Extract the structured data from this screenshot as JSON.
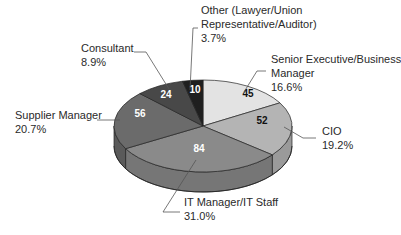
{
  "chart_data": {
    "type": "pie",
    "style": "3d-exploded-none",
    "title": "",
    "start_angle_deg": 0,
    "direction": "clockwise",
    "slices": [
      {
        "label": "Senior Executive/Business Manager",
        "label_lines": [
          "Senior Executive/Business",
          "Manager",
          "16.6%"
        ],
        "value": 45,
        "percent": "16.6%",
        "color": "#e3e3e3",
        "side": "#c4c4c4",
        "value_color": "#111111"
      },
      {
        "label": "CIO",
        "label_lines": [
          "CIO",
          "19.2%"
        ],
        "value": 52,
        "percent": "19.2%",
        "color": "#b4b4b4",
        "side": "#9a9a9a",
        "value_color": "#111111"
      },
      {
        "label": "IT Manager/IT Staff",
        "label_lines": [
          "IT Manager/IT Staff",
          "31.0%"
        ],
        "value": 84,
        "percent": "31.0%",
        "color": "#8a8a8a",
        "side": "#767676",
        "value_color": "#ffffff"
      },
      {
        "label": "Supplier Manager",
        "label_lines": [
          "Supplier Manager",
          "20.7%"
        ],
        "value": 56,
        "percent": "20.7%",
        "color": "#6b6b6b",
        "side": "#5a5a5a",
        "value_color": "#ffffff"
      },
      {
        "label": "Consultant",
        "label_lines": [
          "Consultant",
          "8.9%"
        ],
        "value": 24,
        "percent": "8.9%",
        "color": "#484848",
        "side": "#3a3a3a",
        "value_color": "#ffffff"
      },
      {
        "label": "Other (Lawyer/Union Representative/Auditor)",
        "label_lines": [
          "Other (Lawyer/Union",
          "Representative/Auditor)",
          "3.7%"
        ],
        "value": 10,
        "percent": "3.7%",
        "color": "#1f1f1f",
        "side": "#151515",
        "value_color": "#ffffff"
      }
    ],
    "total": 271,
    "legend": "none (callout labels with leader lines)"
  },
  "layout": {
    "cx": 203,
    "cy": 126,
    "rx": 89,
    "ry": 46,
    "depth": 20,
    "value_pos": [
      [
        248,
        97
      ],
      [
        262,
        124
      ],
      [
        199,
        152
      ],
      [
        140,
        117
      ],
      [
        166,
        98
      ],
      [
        195,
        93
      ]
    ],
    "labels": [
      {
        "x": 271,
        "y": 63,
        "line_h": 14
      },
      {
        "x": 322,
        "y": 135,
        "line_h": 14
      },
      {
        "x": 184,
        "y": 206,
        "line_h": 14
      },
      {
        "x": 15,
        "y": 119,
        "line_h": 14
      },
      {
        "x": 81,
        "y": 52,
        "line_h": 14
      },
      {
        "x": 201,
        "y": 14,
        "line_h": 14
      }
    ],
    "leaders": [
      [
        [
          266,
          71
        ],
        [
          257,
          71
        ],
        [
          244,
          92
        ]
      ],
      [
        [
          284,
          127
        ],
        [
          303,
          138
        ],
        [
          316,
          138
        ]
      ],
      [
        [
          196,
          160
        ],
        [
          163,
          212
        ],
        [
          180,
          212
        ]
      ],
      [
        [
          97,
          120
        ],
        [
          120,
          120
        ]
      ],
      [
        [
          134,
          52
        ],
        [
          146,
          52
        ],
        [
          169,
          89
        ]
      ],
      [
        [
          198,
          28
        ],
        [
          193,
          28
        ],
        [
          190,
          90
        ]
      ]
    ]
  }
}
